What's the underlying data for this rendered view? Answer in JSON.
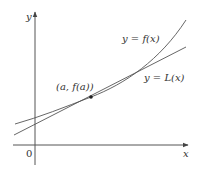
{
  "diagram": {
    "axes": {
      "x_label": "x",
      "y_label": "y",
      "origin_label": "0"
    },
    "curves": [
      {
        "name": "function",
        "label": "y = f(x)"
      },
      {
        "name": "tangent",
        "label": "y = L(x)"
      }
    ],
    "point": {
      "label": "(a, f(a))"
    },
    "colors": {
      "stroke": "#444444",
      "text": "#333333"
    }
  }
}
